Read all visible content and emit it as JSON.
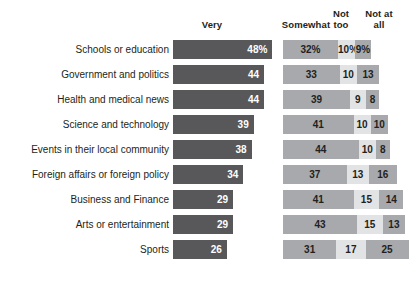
{
  "chart_data": {
    "type": "bar",
    "subtype": "grouped-horizontal-with-stacked-remainder",
    "title": "",
    "subtitle": "",
    "xlabel": "",
    "ylabel": "",
    "grid": false,
    "legend_position": "top",
    "axis_note": "percent of respondents, 0-100",
    "xlim": [
      0,
      100
    ],
    "categories": [
      "Schools or education",
      "Government and politics",
      "Health and medical news",
      "Science and technology",
      "Events in their local community",
      "Foreign affairs or foreign policy",
      "Business and Finance",
      "Arts or entertainment",
      "Sports"
    ],
    "series": [
      {
        "name": "Very",
        "values": [
          48,
          44,
          44,
          39,
          38,
          34,
          29,
          29,
          26
        ]
      },
      {
        "name": "Somewhat",
        "values": [
          32,
          33,
          39,
          41,
          44,
          37,
          41,
          43,
          31
        ]
      },
      {
        "name": "Not too",
        "values": [
          10,
          10,
          9,
          10,
          10,
          13,
          15,
          15,
          17
        ]
      },
      {
        "name": "Not at all",
        "values": [
          9,
          13,
          8,
          10,
          8,
          16,
          14,
          13,
          25
        ]
      }
    ],
    "colors": {
      "very": "#58585a",
      "somewhat": "#a7a9ac",
      "not_too": "#e2e3e4",
      "not_at_all": "#a7a9ac",
      "background": "#ffffff",
      "text": "#231f20",
      "bar_value_text": "#ffffff"
    }
  },
  "headers": {
    "very": "Very",
    "somewhat": "Somewhat",
    "not_too_line1": "Not",
    "not_too_line2": "too",
    "not_at_all_line1": "Not at",
    "not_at_all_line2": "all"
  },
  "rows": [
    {
      "label": "Schools or education",
      "very": 48,
      "very_text": "48%",
      "somewhat": 32,
      "somewhat_text": "32%",
      "not_too": 10,
      "not_too_text": "10%",
      "not_at_all": 9,
      "not_at_all_text": "9%"
    },
    {
      "label": "Government and politics",
      "very": 44,
      "very_text": "44",
      "somewhat": 33,
      "somewhat_text": "33",
      "not_too": 10,
      "not_too_text": "10",
      "not_at_all": 13,
      "not_at_all_text": "13"
    },
    {
      "label": "Health and medical news",
      "very": 44,
      "very_text": "44",
      "somewhat": 39,
      "somewhat_text": "39",
      "not_too": 9,
      "not_too_text": "9",
      "not_at_all": 8,
      "not_at_all_text": "8"
    },
    {
      "label": "Science and technology",
      "very": 39,
      "very_text": "39",
      "somewhat": 41,
      "somewhat_text": "41",
      "not_too": 10,
      "not_too_text": "10",
      "not_at_all": 10,
      "not_at_all_text": "10"
    },
    {
      "label": "Events in their local community",
      "very": 38,
      "very_text": "38",
      "somewhat": 44,
      "somewhat_text": "44",
      "not_too": 10,
      "not_too_text": "10",
      "not_at_all": 8,
      "not_at_all_text": "8"
    },
    {
      "label": "Foreign affairs or foreign policy",
      "very": 34,
      "very_text": "34",
      "somewhat": 37,
      "somewhat_text": "37",
      "not_too": 13,
      "not_too_text": "13",
      "not_at_all": 16,
      "not_at_all_text": "16"
    },
    {
      "label": "Business and Finance",
      "very": 29,
      "very_text": "29",
      "somewhat": 41,
      "somewhat_text": "41",
      "not_too": 15,
      "not_too_text": "15",
      "not_at_all": 14,
      "not_at_all_text": "14"
    },
    {
      "label": "Arts or entertainment",
      "very": 29,
      "very_text": "29",
      "somewhat": 43,
      "somewhat_text": "43",
      "not_too": 15,
      "not_too_text": "15",
      "not_at_all": 13,
      "not_at_all_text": "13"
    },
    {
      "label": "Sports",
      "very": 26,
      "very_text": "26",
      "somewhat": 31,
      "somewhat_text": "31",
      "not_too": 17,
      "not_too_text": "17",
      "not_at_all": 25,
      "not_at_all_text": "25"
    }
  ],
  "scale": {
    "very_px_per_unit": 2.07,
    "stack_px_per_unit": 1.72
  }
}
